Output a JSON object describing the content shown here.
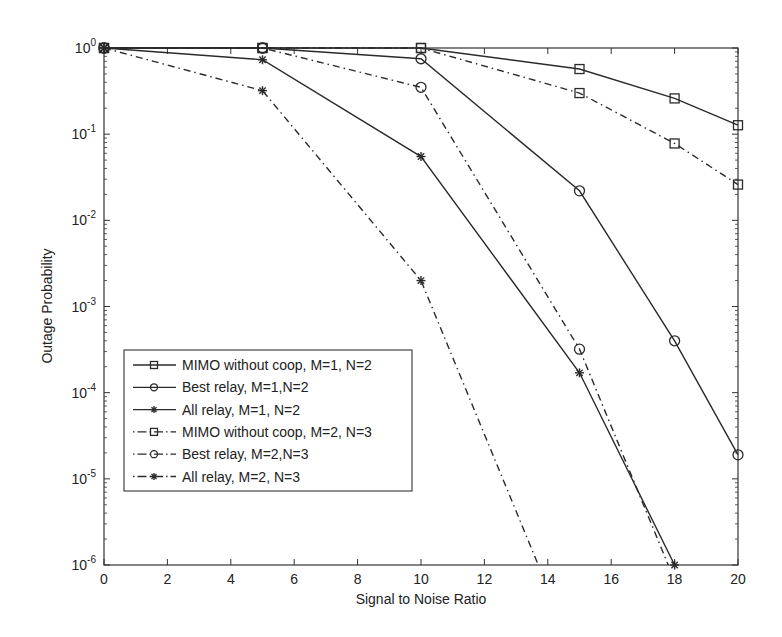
{
  "chart_data": {
    "type": "line",
    "title": "",
    "xlabel": "Signal to Noise Ratio",
    "ylabel": "Outage Probability",
    "xlim": [
      0,
      20
    ],
    "ylim": [
      1e-06,
      1
    ],
    "yscale": "log",
    "grid": false,
    "legend_position": "lower left (inside)",
    "x_ticks": [
      0,
      2,
      4,
      6,
      8,
      10,
      12,
      14,
      16,
      18,
      20
    ],
    "y_ticks": [
      "10^0",
      "10^-1",
      "10^-2",
      "10^-3",
      "10^-4",
      "10^-5",
      "10^-6"
    ],
    "series": [
      {
        "name": "MIMO without coop, M=1, N=2",
        "line": "solid",
        "marker": "square",
        "x": [
          0,
          5,
          10,
          15,
          18,
          20
        ],
        "values": [
          1,
          1,
          1,
          0.57,
          0.26,
          0.127
        ]
      },
      {
        "name": "Best relay, M=1,N=2",
        "line": "solid",
        "marker": "circle",
        "x": [
          0,
          5,
          10,
          15,
          18,
          20
        ],
        "values": [
          1,
          1,
          0.75,
          0.022,
          0.0004,
          1.9e-05
        ]
      },
      {
        "name": "All relay, M=1, N=2",
        "line": "solid",
        "marker": "star",
        "x": [
          0,
          5,
          10,
          15,
          18
        ],
        "values": [
          1,
          0.73,
          0.055,
          0.00017,
          1e-06
        ]
      },
      {
        "name": "MIMO without coop, M=2, N=3",
        "line": "dashdot",
        "marker": "square",
        "x": [
          0,
          5,
          10,
          15,
          18,
          20
        ],
        "values": [
          1,
          1,
          1,
          0.3,
          0.078,
          0.026
        ]
      },
      {
        "name": "Best relay, M=2,N=3",
        "line": "dashdot",
        "marker": "circle",
        "x": [
          0,
          5,
          10,
          15,
          17.8
        ],
        "values": [
          1,
          1,
          0.35,
          0.00032,
          1e-06
        ]
      },
      {
        "name": "All relay, M=2, N=3",
        "line": "dashdot",
        "marker": "star",
        "x": [
          0,
          5,
          10,
          13.7
        ],
        "values": [
          1,
          0.32,
          0.002,
          1e-06
        ]
      }
    ]
  },
  "layout": {
    "plot": {
      "left": 104,
      "right": 738,
      "top": 48,
      "bottom": 565
    },
    "line_color": "#2a2a2a",
    "axis_color": "#333333"
  }
}
